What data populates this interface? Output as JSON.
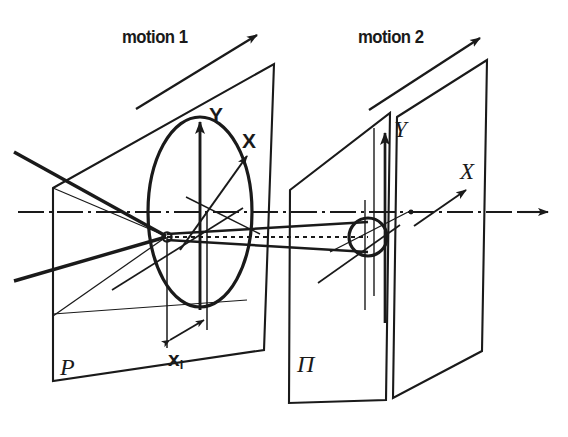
{
  "figure": {
    "type": "technical-optical-diagram",
    "background_color": "#ffffff",
    "ink_color": "#1a1a1a",
    "width": 568,
    "height": 437
  },
  "labels": {
    "motion_1": "motion 1",
    "motion_2": "motion 2",
    "lens_axis_y": "Y",
    "lens_axis_x": "X",
    "image_axis_y": "Y",
    "image_axis_x": "X",
    "plane_p": "P",
    "plane_pi": "Π",
    "dimension_x": "x",
    "dimension_x_sub": "i"
  },
  "elements": {
    "object_plane": "plane-P",
    "intermediate_plane": "plane-Pi",
    "image_plane": "plane-image",
    "lens": "lens-ellipse",
    "lens_center": "lens-center-point",
    "image_point": "image-point-circle",
    "optical_axis": "optical-axis-dash-dot",
    "chief_ray": "chief-ray-dotted",
    "motion_arrow_1": "motion-arrow-1",
    "motion_arrow_2": "motion-arrow-2",
    "dimension_arrow": "dimension-arrow-xi"
  },
  "colors": {
    "ink": "#1a1a1a",
    "background": "#ffffff"
  }
}
